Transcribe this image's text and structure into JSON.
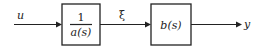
{
  "diagram": {
    "type": "block-diagram",
    "input_signal": "u",
    "intermediate_signal": "ξ",
    "output_signal": "y",
    "blocks": [
      {
        "id": "block-1",
        "numerator": "1",
        "denominator": "a(s)"
      },
      {
        "id": "block-2",
        "label": "b(s)"
      }
    ],
    "colors": {
      "stroke": "#222222",
      "background": "#ffffff"
    }
  }
}
